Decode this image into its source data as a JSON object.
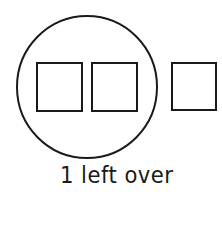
{
  "diagram": {
    "stroke_color": "#1a1a1a",
    "group_circle": {
      "cx": 87,
      "cy": 87,
      "rx": 70,
      "ry": 71
    },
    "grouped_squares": [
      {
        "x": 37,
        "y": 63,
        "w": 45,
        "h": 48
      },
      {
        "x": 92,
        "y": 63,
        "w": 45,
        "h": 48
      }
    ],
    "leftover_squares": [
      {
        "x": 172,
        "y": 63,
        "w": 44,
        "h": 47
      }
    ],
    "grouped_count": 2,
    "leftover_count": 1,
    "caption": "1 left over"
  }
}
